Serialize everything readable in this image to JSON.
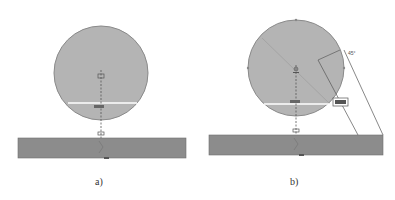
{
  "panels": [
    {
      "id": "a",
      "caption": "a)",
      "circle_label": "Ø4.8",
      "center_mark": "⊕"
    },
    {
      "id": "b",
      "caption": "b)",
      "circle_label": "Ø4.8",
      "angle_label": "45°",
      "dimension_box": "XXX",
      "center_mark": "⊕"
    }
  ],
  "colors": {
    "circle_fill": "#b4b4b4",
    "circle_stroke": "#8a8a8a",
    "bar_fill": "#8c8c8c",
    "bar_stroke": "#6e6e6e",
    "line": "#444444",
    "cut_line": "#ffffff"
  }
}
